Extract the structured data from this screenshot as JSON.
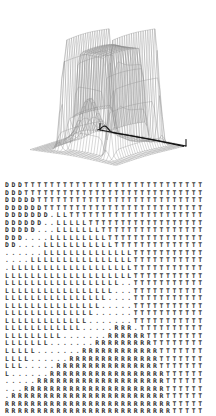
{
  "figure": {
    "panels": [
      {
        "name": "surface-plot",
        "type": "3d-wireframe-surface"
      },
      {
        "name": "character-grid",
        "type": "ascii-classification-map"
      }
    ]
  },
  "colors": {
    "background": "#ffffff",
    "mesh_line": "#8a8a8a",
    "silhouette_line": "#111111",
    "base_line": "#111111",
    "char_D": "#303030",
    "char_T": "#3a3a3a",
    "char_L": "#333333",
    "char_R": "#2a2a2a",
    "char_dot": "#555555"
  },
  "chart_data": {
    "type": "heatmap",
    "title": "",
    "subtitle": "",
    "xlabel": "",
    "ylabel": "",
    "legend": [],
    "grid": false,
    "annotations": [],
    "surface": {
      "type": "surface",
      "description": "Two tall narrow ridges flank a broad flat plateau; a small secondary bump sits at the left front; the surface falls to a flat base plane.",
      "mesh_rows": 30,
      "mesh_cols": 30,
      "peaks": [
        {
          "label": "left-ridge",
          "relative_height": 1.0
        },
        {
          "label": "right-ridge",
          "relative_height": 1.0
        },
        {
          "label": "center-plateau",
          "relative_height": 0.82
        },
        {
          "label": "front-left-bump",
          "relative_height": 0.33
        }
      ]
    },
    "symbols": {
      "D": "class D region",
      "T": "class T region",
      "L": "class L region",
      "R": "class R region",
      ".": "unclassified / boundary"
    },
    "rows": 31,
    "cols": 31,
    "cells": [
      "DDDTTTTTTTTTTTTTTTTTTTTTTTTTTTT",
      "DDDTTTTTTTTTTTTTTTTTTTTTTTTTTTT",
      "DDDDDTTTTTTTTTTTTTTTTTTTTTTTTTT",
      "DDDDDDTTTTTTTTTTTTTTTTTTTTTTTTT",
      "DDDDDDD.LLTTTTTTTTTTTTTTTTTTTTT",
      "DDDDDD..LLLLLTTTTTTTTTTTTTTTTTT",
      "DDDDD...LLLLLLLTTTTTTTTTTTTTTTT",
      "DDD....LLLLLLLLLTTTTTTTTTTTTTTT",
      "DD....LLLLLLLLLLLTTTTTTTTTTTTTT",
      "......LLLLLLLLLLLLLLTTTTTTTTTTT",
      "....LLLLLLLLLLLLLLLLTTTTTTTTTTT",
      ".LLLLLLLLLLLLLLLLLLLTTTTTTTTTTT",
      "LLLLLLLLLLLLLLLLLLLLTTTTTTTTTTT",
      "LLLLLLLLLLLLLLLLLL..TTTTTTTTTTT",
      "LLLLLLLLLLLLLLLLL...TTTTTTTTTTT",
      "LLLLLLLLLLLLLLLL....TTTTTTTTTTT",
      "LLLLLLLLLLLLLLL.....TTTTTTTTTTT",
      "LLLLLLLLLLLLLL......TTTTTTTTTTT",
      "LLLLLLLLLLLLL.......TTTTTTTTTTT",
      "LLLLLLLLLLLL.....RRR.TTTTTTTTTT",
      "LLLLLLLLL.......RRRRRRTTTTTTTTT",
      "LLLLLLL.......RRRRRRRRRTTTTTTTT",
      "LLLLL.......RRRRRRRRRRRRTTTTTTT",
      "LLLL......RRRRRRRRRRRRRRTTTTTTT",
      "LLL.....RRRRRRRRRRRRRRRRTTTTTTT",
      "L......RRRRRRRRRRRRRRRRRRTTTTTT",
      ".....RRRRRRRRRRRRRRRRRRRRTTTTTT",
      "...RRRRRRRRRRRRRRRRRRRRRRTTTTTT",
      ".RRRRRRRRRRRRRRRRRRRRRRRRTTTTTT",
      "RRRRRRRRRRRRRRRRRRRRRRRRRRTTTTT",
      "RRRRRRRRRRRRRRRRRRRRRRRRRRTTTTT"
    ]
  }
}
